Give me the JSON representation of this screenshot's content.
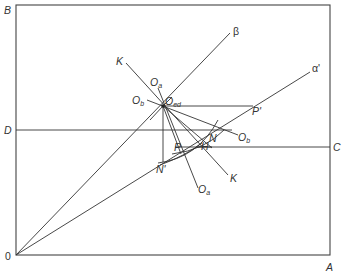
{
  "diagram": {
    "title": "",
    "frame": {
      "corners": [
        "B",
        "A",
        "0"
      ]
    },
    "labels": {
      "B": "B",
      "D": "D",
      "O": "0",
      "A": "A",
      "C": "C",
      "beta": "β",
      "alpha_prime": "α'",
      "K_top": "K",
      "K_bottom": "K",
      "Oa_top": "O",
      "Oa_top_sub": "a",
      "Ob_left": "O",
      "Ob_left_sub": "b",
      "Oed": "O",
      "Oed_sub": "ed",
      "P_prime": "P'",
      "N": "N",
      "H": "H",
      "P": "P",
      "N_prime": "N'",
      "Ob_right": "O",
      "Ob_right_sub": "b",
      "Oa_bottom": "O",
      "Oa_bottom_sub": "a"
    }
  }
}
